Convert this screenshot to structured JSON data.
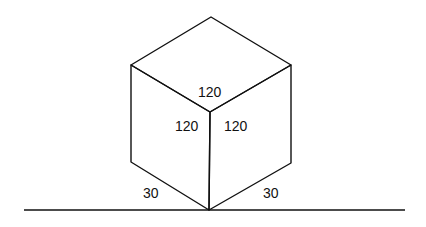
{
  "diagram": {
    "type": "isometric-cube",
    "labels": {
      "top_face": "120",
      "left_face": "120",
      "right_face": "120",
      "left_angle": "30",
      "right_angle": "30"
    },
    "colors": {
      "line": "#111111",
      "background": "#ffffff"
    }
  }
}
